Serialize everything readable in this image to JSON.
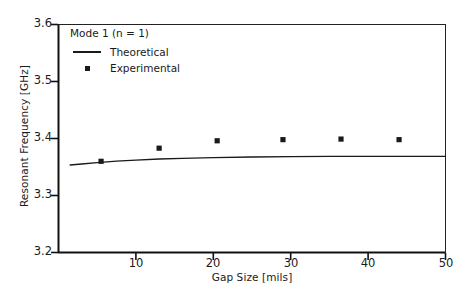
{
  "chart_data": {
    "type": "scatter",
    "title": "",
    "xlabel": "Gap Size [mils]",
    "ylabel": "Resonant Frequency [GHz]",
    "xlim": [
      0,
      50
    ],
    "ylim": [
      3.2,
      3.6
    ],
    "xticks": [
      10,
      20,
      30,
      40,
      50
    ],
    "xtick_labels": [
      "10",
      "20",
      "30",
      "40",
      "50"
    ],
    "yticks": [
      3.2,
      3.3,
      3.4,
      3.5,
      3.6
    ],
    "ytick_labels": [
      "3.2",
      "3.3",
      "3.4",
      "3.5",
      "3.6"
    ],
    "grid": false,
    "legend_position": "upper left",
    "annotations": [
      "Mode 1 (n = 1)"
    ],
    "series": [
      {
        "name": "Theoretical",
        "type": "line",
        "color": "#1a1a1a",
        "x": [
          1.5,
          3,
          5,
          7.5,
          10,
          13,
          16,
          20,
          25,
          30,
          35,
          40,
          45,
          50
        ],
        "y": [
          3.3535,
          3.3553,
          3.3578,
          3.3603,
          3.3622,
          3.364,
          3.3653,
          3.3665,
          3.3675,
          3.3681,
          3.3685,
          3.3687,
          3.3688,
          3.3688
        ]
      },
      {
        "name": "Experimental",
        "type": "scatter",
        "color": "#1a1a1a",
        "marker": "square",
        "x": [
          5.5,
          13.0,
          20.5,
          29.0,
          36.5,
          44.0
        ],
        "y": [
          3.36,
          3.383,
          3.396,
          3.398,
          3.399,
          3.398
        ]
      }
    ]
  },
  "legend": {
    "title": "Mode 1 (n = 1)",
    "items": [
      {
        "label": "Theoretical",
        "key": "line-key"
      },
      {
        "label": "Experimental",
        "key": "square-marker-key"
      }
    ]
  },
  "axes": {
    "x_title": "Gap Size [mils]",
    "y_title": "Resonant Frequency [GHz]"
  }
}
